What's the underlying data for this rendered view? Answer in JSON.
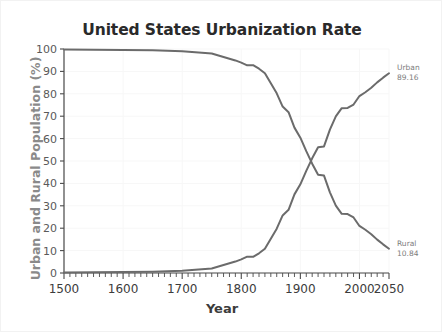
{
  "chart_data": {
    "type": "line",
    "title": "United States Urbanization Rate",
    "xlabel": "Year",
    "ylabel": "Urban and Rural Population (%)",
    "xlim": [
      1500,
      2050
    ],
    "ylim": [
      0,
      100
    ],
    "grid": true,
    "legend_position": "inline-right-annotations",
    "x_ticks": [
      1500,
      1600,
      1700,
      1800,
      1900,
      2000,
      2050
    ],
    "x_tick_labels": [
      "1500",
      "1600",
      "1700",
      "1800",
      "1900",
      "2000",
      "2050"
    ],
    "y_ticks": [
      0,
      10,
      20,
      30,
      40,
      50,
      60,
      70,
      80,
      90,
      100
    ],
    "y_tick_labels": [
      "0",
      "10",
      "20",
      "30",
      "40",
      "50",
      "60",
      "70",
      "80",
      "90",
      "100"
    ],
    "x": [
      1500,
      1550,
      1600,
      1650,
      1700,
      1750,
      1790,
      1800,
      1810,
      1820,
      1830,
      1840,
      1850,
      1860,
      1870,
      1880,
      1890,
      1900,
      1910,
      1920,
      1930,
      1940,
      1950,
      1960,
      1970,
      1980,
      1990,
      2000,
      2010,
      2020,
      2030,
      2040,
      2050
    ],
    "series": [
      {
        "name": "Urban",
        "end_label": "Urban",
        "end_value": 89.16,
        "color": "#6b6b6b",
        "values": [
          0.2,
          0.3,
          0.4,
          0.6,
          1.0,
          2.0,
          5.1,
          6.1,
          7.3,
          7.2,
          8.8,
          10.8,
          15.3,
          19.8,
          25.7,
          28.2,
          35.1,
          39.6,
          45.6,
          51.2,
          56.1,
          56.5,
          64.0,
          69.9,
          73.6,
          73.7,
          75.2,
          79.0,
          80.7,
          82.7,
          85.1,
          87.2,
          89.16
        ]
      },
      {
        "name": "Rural",
        "end_label": "Rural",
        "end_value": 10.84,
        "color": "#6b6b6b",
        "values": [
          99.8,
          99.7,
          99.6,
          99.4,
          99.0,
          98.0,
          94.9,
          93.9,
          92.7,
          92.8,
          91.2,
          89.2,
          84.7,
          80.2,
          74.3,
          71.8,
          64.9,
          60.4,
          54.4,
          48.8,
          43.9,
          43.5,
          36.0,
          30.1,
          26.4,
          26.3,
          24.8,
          21.0,
          19.3,
          17.3,
          14.9,
          12.8,
          10.84
        ]
      }
    ]
  }
}
